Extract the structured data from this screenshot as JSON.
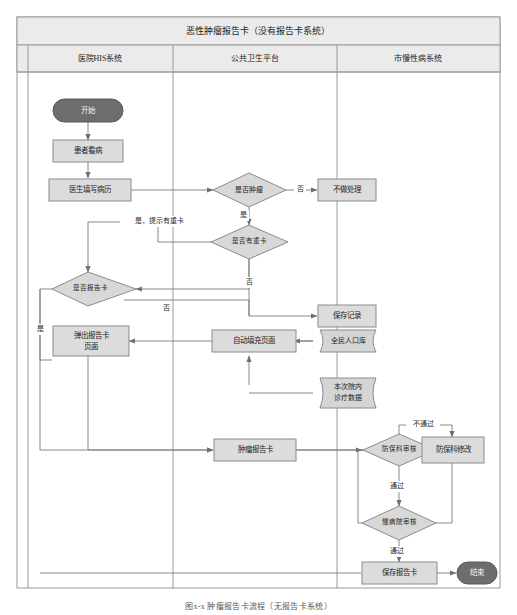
{
  "figure": {
    "title": "恶性肿瘤报告卡（没有报告卡系统）",
    "caption": "图x-x 肿瘤报告卡流程（无报告卡系统）"
  },
  "lanes": [
    {
      "id": "his",
      "label": "医院HIS系统"
    },
    {
      "id": "pub",
      "label": "公共卫生平台"
    },
    {
      "id": "chron",
      "label": "市慢性病系统"
    }
  ],
  "colors": {
    "frame_border": "#9a9a9a",
    "header_fill": "#ebebeb",
    "lane_header_fill": "#ebebeb",
    "process_fill": "#dcdcdc",
    "process_stroke": "#8c8c8c",
    "decision_fill": "#d8d8d8",
    "decision_stroke": "#8c8c8c",
    "terminator_fill": "#6d6d6d",
    "terminator_text": "#f2f2f2",
    "database_fill": "#d5d5d5",
    "edge_stroke": "#7c7c7c",
    "canvas": "#ffffff"
  },
  "nodes": [
    {
      "id": "start",
      "shape": "terminator",
      "lane": "his",
      "label": "开始"
    },
    {
      "id": "visit",
      "shape": "process",
      "lane": "his",
      "label": "患者看病"
    },
    {
      "id": "writerec",
      "shape": "process",
      "lane": "his",
      "label": "医生填写病历"
    },
    {
      "id": "istumor",
      "shape": "decision",
      "lane": "pub",
      "label": "是否肿瘤"
    },
    {
      "id": "noaction",
      "shape": "process",
      "lane": "pub",
      "label": "不做处理"
    },
    {
      "id": "isdup",
      "shape": "decision",
      "lane": "pub",
      "label": "是否有重卡"
    },
    {
      "id": "iscard",
      "shape": "decision",
      "lane": "his",
      "label": "是否报告卡"
    },
    {
      "id": "saverec",
      "shape": "process",
      "lane": "pub",
      "label": "保存记录"
    },
    {
      "id": "popupcard",
      "shape": "process",
      "lane": "his",
      "label": "弹出报告卡\n页面"
    },
    {
      "id": "autofill",
      "shape": "process",
      "lane": "pub",
      "label": "自动填充页面"
    },
    {
      "id": "popdb",
      "shape": "database",
      "lane": "pub",
      "label": "全民人口库"
    },
    {
      "id": "visitdb",
      "shape": "database",
      "lane": "pub",
      "label": "本次院内\n诊疗数据"
    },
    {
      "id": "tumorcard",
      "shape": "process",
      "lane": "pub",
      "label": "肿瘤报告卡"
    },
    {
      "id": "deptaudit",
      "shape": "decision",
      "lane": "chron",
      "label": "防保科审核"
    },
    {
      "id": "deptmodify",
      "shape": "process",
      "lane": "chron",
      "label": "防保科修改"
    },
    {
      "id": "hospaudit",
      "shape": "decision",
      "lane": "chron",
      "label": "慢病院审核"
    },
    {
      "id": "savecard",
      "shape": "process",
      "lane": "chron",
      "label": "保存报告卡"
    },
    {
      "id": "end",
      "shape": "terminator",
      "lane": "chron",
      "label": "结束"
    }
  ],
  "edge_labels": {
    "tumor_no": "否",
    "tumor_yes": "是",
    "dup_yes": "是，提示有重卡",
    "dup_no": "否",
    "card_no": "否",
    "card_yes": "是",
    "dept_fail": "不通过",
    "dept_pass": "通过",
    "hosp_pass": "通过"
  }
}
